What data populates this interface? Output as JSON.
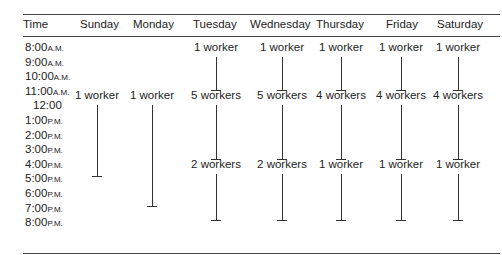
{
  "table": {
    "headers": [
      "Time",
      "Sunday",
      "Monday",
      "Tuesday",
      "Wednesday",
      "Thursday",
      "Friday",
      "Saturday"
    ],
    "times": [
      {
        "t": "8:00",
        "s": "A.M."
      },
      {
        "t": "9:00",
        "s": "A.M."
      },
      {
        "t": "10:00",
        "s": "A.M."
      },
      {
        "t": "11:00",
        "s": "A.M."
      },
      {
        "t": "12:00",
        "s": ""
      },
      {
        "t": "1:00",
        "s": "P.M."
      },
      {
        "t": "2:00",
        "s": "P.M."
      },
      {
        "t": "3:00",
        "s": "P.M."
      },
      {
        "t": "4:00",
        "s": "P.M."
      },
      {
        "t": "5:00",
        "s": "P.M."
      },
      {
        "t": "6:00",
        "s": "P.M."
      },
      {
        "t": "7:00",
        "s": "P.M."
      },
      {
        "t": "8:00",
        "s": "P.M."
      }
    ],
    "schedule": {
      "sunday": [
        {
          "label": "1 worker",
          "from": "11:00 A.M.",
          "to": "5:00 P.M."
        }
      ],
      "monday": [
        {
          "label": "1 worker",
          "from": "11:00 A.M.",
          "to": "7:00 P.M."
        }
      ],
      "tuesday": [
        {
          "label": "1 worker",
          "from": "8:00 A.M.",
          "to": "11:00 A.M."
        },
        {
          "label": "5 workers",
          "from": "11:00 A.M.",
          "to": "3:00 P.M."
        },
        {
          "label": "2 workers",
          "from": "3:00 P.M.",
          "to": "8:00 P.M."
        }
      ],
      "wednesday": [
        {
          "label": "1 worker",
          "from": "8:00 A.M.",
          "to": "11:00 A.M."
        },
        {
          "label": "5 workers",
          "from": "11:00 A.M.",
          "to": "3:00 P.M."
        },
        {
          "label": "2 workers",
          "from": "3:00 P.M.",
          "to": "8:00 P.M."
        }
      ],
      "thursday": [
        {
          "label": "1 worker",
          "from": "8:00 A.M.",
          "to": "11:00 A.M."
        },
        {
          "label": "4 workers",
          "from": "11:00 A.M.",
          "to": "3:00 P.M."
        },
        {
          "label": "1 worker",
          "from": "3:00 P.M.",
          "to": "8:00 P.M."
        }
      ],
      "friday": [
        {
          "label": "1 worker",
          "from": "8:00 A.M.",
          "to": "11:00 A.M."
        },
        {
          "label": "4 workers",
          "from": "11:00 A.M.",
          "to": "3:00 P.M."
        },
        {
          "label": "1 worker",
          "from": "3:00 P.M.",
          "to": "8:00 P.M."
        }
      ],
      "saturday": [
        {
          "label": "1 worker",
          "from": "8:00 A.M.",
          "to": "11:00 A.M."
        },
        {
          "label": "4 workers",
          "from": "11:00 A.M.",
          "to": "3:00 P.M."
        },
        {
          "label": "1 worker",
          "from": "3:00 P.M.",
          "to": "8:00 P.M."
        }
      ]
    }
  }
}
